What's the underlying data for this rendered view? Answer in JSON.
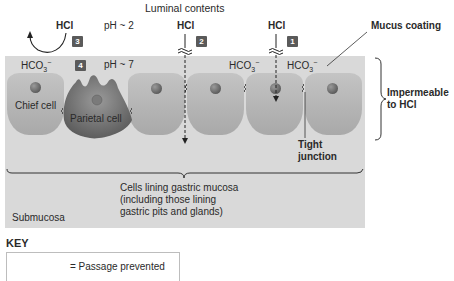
{
  "title": "Luminal contents",
  "labels": {
    "hcl_left": "HCl",
    "hcl_middle": "HCl",
    "hcl_right": "HCl",
    "ph_lumen": "pH ~ 2",
    "ph_mucus": "pH ~ 7",
    "hco3_left": "HCO",
    "hco3_mid": "HCO",
    "hco3_right": "HCO",
    "hco3_sub": "3",
    "hco3_sup": "−",
    "mucus_coating": "Mucus coating",
    "impermeable_line1": "Impermeable",
    "impermeable_line2": "to HCl",
    "chief_cell": "Chief cell",
    "parietal_cell": "Parietal cell",
    "tight_junction_line1": "Tight",
    "tight_junction_line2": "junction",
    "cells_lining_line1": "Cells lining gastric mucosa",
    "cells_lining_line2": "(including those lining",
    "cells_lining_line3": "gastric pits and glands)",
    "submucosa": "Submucosa"
  },
  "badges": {
    "b1": "1",
    "b2": "2",
    "b3": "3",
    "b4": "4"
  },
  "key": {
    "title": "KEY",
    "entry": "= Passage prevented"
  },
  "colors": {
    "mucus_band": "#d9d9d9",
    "cell": "#b8b8b8",
    "parietal": "#7f7f7f",
    "badge": "#5a5a5a"
  }
}
